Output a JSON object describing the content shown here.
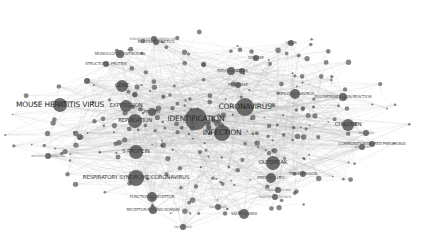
{
  "network": {
    "type": "keyword co-occurrence map",
    "colors": {
      "node": "#555555",
      "edge": "#b0b0b0",
      "label": "#333333",
      "background": "#ffffff"
    },
    "nodes": [
      {
        "id": "coronavirus",
        "label": "CORONAVIRUS",
        "x": 245,
        "y": 107,
        "r": 9,
        "size": 4
      },
      {
        "id": "infection",
        "label": "INFECTION",
        "x": 222,
        "y": 133,
        "r": 8,
        "size": 4
      },
      {
        "id": "identification",
        "label": "IDENTIFICATION",
        "x": 196,
        "y": 119,
        "r": 11,
        "size": 4
      },
      {
        "id": "mouse-hepatitis-virus",
        "label": "MOUSE HEPATITIS VIRUS",
        "x": 60,
        "y": 105,
        "r": 7,
        "size": 4
      },
      {
        "id": "expression",
        "label": "EXPRESSION",
        "x": 126,
        "y": 106,
        "r": 6,
        "size": 3
      },
      {
        "id": "replication",
        "label": "REPLICATION",
        "x": 135,
        "y": 121,
        "r": 7,
        "size": 3
      },
      {
        "id": "s-protein",
        "label": "S PROTEIN",
        "x": 136,
        "y": 152,
        "r": 7,
        "size": 3
      },
      {
        "id": "respiratory-syndrome-coronavirus",
        "label": "RESPIRATORY SYNDROME CORONAVIRUS",
        "x": 136,
        "y": 178,
        "r": 8,
        "size": 3
      },
      {
        "id": "functional-receptor",
        "label": "FUNCTIONAL RECEPTOR",
        "x": 152,
        "y": 197,
        "r": 5,
        "size": 2
      },
      {
        "id": "receptor-binding-domain",
        "label": "RECEPTOR-BINDING DOMAIN",
        "x": 153,
        "y": 210,
        "r": 4,
        "size": 2
      },
      {
        "id": "saudi-arabia",
        "label": "SAUDI ARABIA",
        "x": 244,
        "y": 214,
        "r": 5,
        "size": 2
      },
      {
        "id": "outbreak",
        "label": "OUTBREAK",
        "x": 273,
        "y": 163,
        "r": 7,
        "size": 3
      },
      {
        "id": "epidemiology",
        "label": "EPIDEMIOLOGY",
        "x": 271,
        "y": 178,
        "r": 5,
        "size": 2
      },
      {
        "id": "polymerase-chain-reaction",
        "label": "POLYMERASE CHAIN REACTION",
        "x": 343,
        "y": 97,
        "r": 4,
        "size": 2
      },
      {
        "id": "children",
        "label": "CHILDREN",
        "x": 348,
        "y": 125,
        "r": 6,
        "size": 3
      },
      {
        "id": "community-acquired-pneumonia",
        "label": "COMMUNITY-ACQUIRED PNEUMONIA",
        "x": 372,
        "y": 144,
        "r": 3,
        "size": 2
      },
      {
        "id": "monoclonal-antibodies",
        "label": "MONOCLONAL ANTIBODIES",
        "x": 120,
        "y": 54,
        "r": 4,
        "size": 2
      },
      {
        "id": "gene",
        "label": "GENE",
        "x": 122,
        "y": 86,
        "r": 6,
        "size": 3
      },
      {
        "id": "pathogenesis",
        "label": "PATHOGENESIS",
        "x": 231,
        "y": 71,
        "r": 4,
        "size": 2
      },
      {
        "id": "sars-coronavirus",
        "label": "SARS CORONAVIRUS",
        "x": 295,
        "y": 94,
        "r": 5,
        "size": 2
      },
      {
        "id": "disease",
        "label": "DISEASE",
        "x": 256,
        "y": 58,
        "r": 3,
        "size": 2
      },
      {
        "id": "virus",
        "label": "VIRUS",
        "x": 291,
        "y": 43,
        "r": 3,
        "size": 2
      },
      {
        "id": "cells",
        "label": "CELLS",
        "x": 242,
        "y": 71,
        "r": 3,
        "size": 2
      },
      {
        "id": "structural-protein",
        "label": "STRUCTURAL PROTEIN",
        "x": 106,
        "y": 64,
        "r": 3,
        "size": 2
      },
      {
        "id": "reverse-genetics",
        "label": "REVERSE GENETICS",
        "x": 156,
        "y": 42,
        "r": 3,
        "size": 2
      },
      {
        "id": "porcine-epidemic-diarrhea-virus",
        "label": "PORCINE EPIDEMIC DIARRHEA VIRUS",
        "x": 154,
        "y": 39,
        "r": 3,
        "size": 1
      },
      {
        "id": "replicase",
        "label": "REPLICASE",
        "x": 238,
        "y": 85,
        "r": 3,
        "size": 2
      },
      {
        "id": "rna",
        "label": "RNA",
        "x": 87,
        "y": 81,
        "r": 3,
        "size": 1
      },
      {
        "id": "nucleocapsid-protein",
        "label": "NUCLEOCAPSID PROTEIN",
        "x": 48,
        "y": 156,
        "r": 3,
        "size": 1
      },
      {
        "id": "household",
        "label": "HOUSEHOLD",
        "x": 183,
        "y": 227,
        "r": 3,
        "size": 1
      },
      {
        "id": "transmission",
        "label": "TRANSMISSION",
        "x": 303,
        "y": 174,
        "r": 3,
        "size": 2
      },
      {
        "id": "hospitalized-patients",
        "label": "HOSPITALIZED PATIENTS",
        "x": 275,
        "y": 197,
        "r": 3,
        "size": 1
      },
      {
        "id": "clinical-features",
        "label": "CLINICAL FEATURES",
        "x": 278,
        "y": 190,
        "r": 3,
        "size": 1
      },
      {
        "id": "middle-east",
        "label": "MIDDLE EAST",
        "x": 218,
        "y": 207,
        "r": 3,
        "size": 1
      },
      {
        "id": "symptoms",
        "label": "SYMPTOMS",
        "x": 362,
        "y": 147,
        "r": 3,
        "size": 1
      },
      {
        "id": "influenza",
        "label": "INFLUENZA",
        "x": 366,
        "y": 133,
        "r": 3,
        "size": 1
      },
      {
        "id": "cats",
        "label": "CATS",
        "x": 80,
        "y": 137,
        "r": 3,
        "size": 1
      },
      {
        "id": "protein",
        "label": "PROTEIN",
        "x": 152,
        "y": 112,
        "r": 4,
        "size": 2
      }
    ],
    "edge_note": "dense co-occurrence links between keyword nodes"
  }
}
